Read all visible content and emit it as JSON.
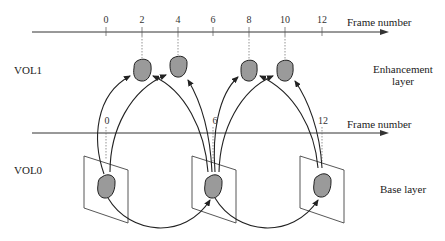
{
  "diagram": {
    "type": "temporal scalability layer diagram",
    "colors": {
      "line": "#222222",
      "object_fill": "#9a9a9a",
      "plane": "#444444",
      "background": "#ffffff"
    },
    "top_axis": {
      "label": "Frame number",
      "ticks": [
        "0",
        "2",
        "4",
        "6",
        "8",
        "10",
        "12"
      ]
    },
    "bottom_axis": {
      "label": "Frame number",
      "ticks": [
        "0",
        "6",
        "12"
      ]
    },
    "layers": {
      "enhancement": {
        "vol_label": "VOL1",
        "name_line1": "Enhancement",
        "name_line2": "layer",
        "frames": [
          "2",
          "4",
          "8",
          "10"
        ]
      },
      "base": {
        "vol_label": "VOL0",
        "name": "Base layer",
        "frames": [
          "0",
          "6",
          "12"
        ]
      }
    }
  }
}
